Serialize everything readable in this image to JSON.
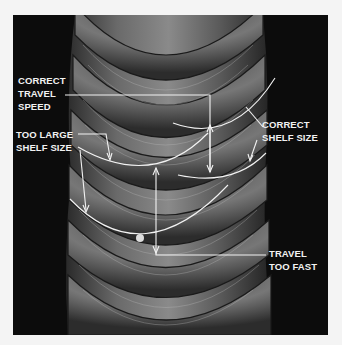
{
  "figure": {
    "background_color": "#f4f4f4",
    "photo_color": "#0c0c0c",
    "annotation_color": "#f2f2f2"
  },
  "annotations": [
    {
      "id": "correct-travel-speed",
      "lines": [
        "CORRECT",
        "TRAVEL",
        "SPEED"
      ]
    },
    {
      "id": "too-large-shelf-size",
      "lines": [
        "TOO LARGE",
        "SHELF SIZE"
      ]
    },
    {
      "id": "correct-shelf-size",
      "lines": [
        "CORRECT",
        "SHELF SIZE"
      ]
    },
    {
      "id": "travel-too-fast",
      "lines": [
        "TRAVEL",
        "TOO FAST"
      ]
    }
  ]
}
